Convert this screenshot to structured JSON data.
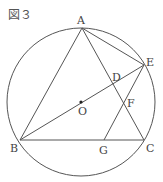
{
  "figure": {
    "title": "図３",
    "stroke_color": "#555555"
  },
  "circle": {
    "center": "O",
    "cx": 81,
    "cy": 102,
    "r": 74
  },
  "points": {
    "A": {
      "label": "A",
      "x": 82,
      "y": 28
    },
    "B": {
      "label": "B",
      "x": 20,
      "y": 140
    },
    "C": {
      "label": "C",
      "x": 144,
      "y": 140
    },
    "D": {
      "label": "D",
      "x": 113,
      "y": 84
    },
    "E": {
      "label": "E",
      "x": 144,
      "y": 65
    },
    "F": {
      "label": "F",
      "x": 124,
      "y": 103
    },
    "G": {
      "label": "G",
      "x": 104,
      "y": 140
    },
    "O": {
      "label": "O",
      "x": 81,
      "y": 102
    }
  },
  "segments": [
    "AB",
    "AC",
    "BC",
    "AE",
    "BE",
    "EG"
  ]
}
